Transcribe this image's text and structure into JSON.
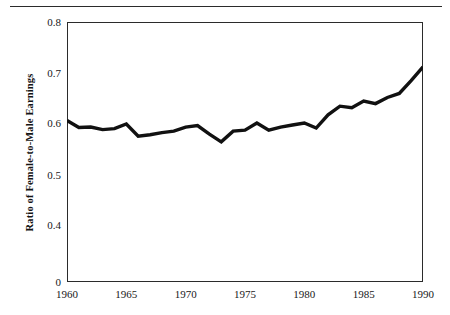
{
  "figure": {
    "has_top_rule": true,
    "frame_color": "#2b2b2b",
    "background": "#ffffff"
  },
  "chart_data": {
    "type": "line",
    "title": "",
    "xlabel": "",
    "ylabel": "Ratio of Female-to-Male Earnings",
    "x": [
      1960,
      1961,
      1962,
      1963,
      1964,
      1965,
      1966,
      1967,
      1968,
      1969,
      1970,
      1971,
      1972,
      1973,
      1974,
      1975,
      1976,
      1977,
      1978,
      1979,
      1980,
      1981,
      1982,
      1983,
      1984,
      1985,
      1986,
      1987,
      1988,
      1989,
      1990
    ],
    "values": [
      0.607,
      0.593,
      0.594,
      0.589,
      0.591,
      0.6,
      0.576,
      0.579,
      0.583,
      0.586,
      0.594,
      0.597,
      0.58,
      0.565,
      0.586,
      0.588,
      0.602,
      0.588,
      0.594,
      0.598,
      0.602,
      0.592,
      0.618,
      0.635,
      0.632,
      0.645,
      0.64,
      0.652,
      0.66,
      0.685,
      0.712
    ],
    "series": [
      {
        "name": "Ratio of Female-to-Male Earnings",
        "color": "#111111",
        "line_width": 3.4,
        "values": [
          0.607,
          0.593,
          0.594,
          0.589,
          0.591,
          0.6,
          0.576,
          0.579,
          0.583,
          0.586,
          0.594,
          0.597,
          0.58,
          0.565,
          0.586,
          0.588,
          0.602,
          0.588,
          0.594,
          0.598,
          0.602,
          0.592,
          0.618,
          0.635,
          0.632,
          0.645,
          0.64,
          0.652,
          0.66,
          0.685,
          0.712
        ]
      }
    ],
    "xlim": [
      1960,
      1990
    ],
    "ylim": [
      0,
      0.8
    ],
    "y_axis_break": {
      "present": true,
      "between": [
        0,
        0.4
      ],
      "note": "Axis is compressed between 0 and 0.4; 0.4-0.8 is linear."
    },
    "yticks": [
      0,
      0.4,
      0.5,
      0.6,
      0.7,
      0.8
    ],
    "ytick_labels": [
      "0",
      "0.4",
      "0.5",
      "0.6",
      "0.7",
      "0.8"
    ],
    "ytick_positions_frac": [
      1.0,
      0.7846,
      0.5885,
      0.3923,
      0.1962,
      0.0
    ],
    "xticks": [
      1960,
      1965,
      1970,
      1975,
      1980,
      1985,
      1990
    ],
    "xtick_labels": [
      "1960",
      "1965",
      "1970",
      "1975",
      "1980",
      "1985",
      "1990"
    ],
    "grid": false,
    "legend": null,
    "legend_position": "none",
    "markers": false
  }
}
